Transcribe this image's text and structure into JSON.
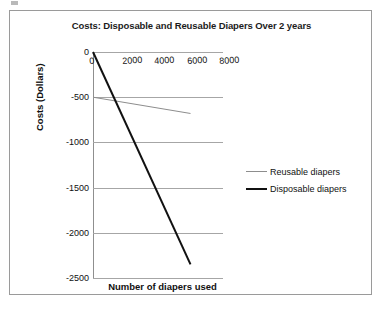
{
  "chart_data": {
    "type": "line",
    "title": "Costs: Disposable and Reusable Diapers Over 2 years",
    "xlabel": "Number of diapers used",
    "ylabel": "Costs (Dollars)",
    "xlim": [
      0,
      8000
    ],
    "ylim": [
      -2500,
      0
    ],
    "xticks": [
      "0",
      "2000",
      "4000",
      "6000",
      "8000"
    ],
    "yticks": [
      "0",
      "-500",
      "-1000",
      "-1500",
      "-2000",
      "-2500"
    ],
    "grid": "horizontal",
    "legend_position": "right",
    "series": [
      {
        "name": "Reusable diapers",
        "color": "#8d8d8d",
        "width": 1,
        "x": [
          0,
          6000
        ],
        "y": [
          -500,
          -680
        ]
      },
      {
        "name": "Disposable diapers",
        "color": "#111111",
        "width": 2,
        "x": [
          0,
          6000
        ],
        "y": [
          0,
          -2350
        ]
      }
    ]
  },
  "legend": {
    "entries": [
      {
        "label": "Reusable diapers"
      },
      {
        "label": "Disposable diapers"
      }
    ]
  }
}
